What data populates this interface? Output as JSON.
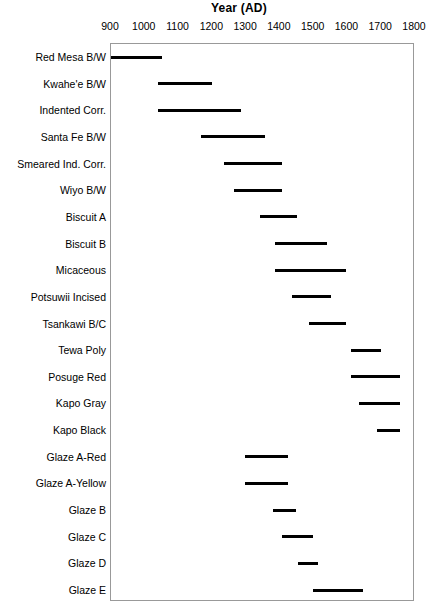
{
  "chart_data": {
    "type": "bar",
    "orientation": "horizontal-range",
    "title": "Year (AD)",
    "xlabel": "Year (AD)",
    "ylabel": "",
    "xlim": [
      900,
      1800
    ],
    "xticks": [
      900,
      1000,
      1100,
      1200,
      1300,
      1400,
      1500,
      1600,
      1700,
      1800
    ],
    "xtick_labels": [
      "900",
      "1000",
      "1100",
      "1200",
      "1300",
      "1400",
      "1500",
      "1600",
      "1700",
      "1800"
    ],
    "grid": false,
    "legend": null,
    "bar_color": "#000000",
    "frame_color": "#999999",
    "categories": [
      "Red Mesa B/W",
      "Kwahe'e B/W",
      "Indented Corr.",
      "Santa Fe B/W",
      "Smeared Ind. Corr.",
      "Wiyo B/W",
      "Biscuit A",
      "Biscuit B",
      "Micaceous",
      "Potsuwii Incised",
      "Tsankawi B/C",
      "Tewa Poly",
      "Posuge Red",
      "Kapo Gray",
      "Kapo Black",
      "Glaze A-Red",
      "Glaze A-Yellow",
      "Glaze B",
      "Glaze C",
      "Glaze D",
      "Glaze E"
    ],
    "ranges": [
      {
        "label": "Red Mesa B/W",
        "start": 900,
        "end": 1050
      },
      {
        "label": "Kwahe'e B/W",
        "start": 1040,
        "end": 1200
      },
      {
        "label": "Indented Corr.",
        "start": 1040,
        "end": 1285
      },
      {
        "label": "Santa Fe B/W",
        "start": 1165,
        "end": 1355
      },
      {
        "label": "Smeared Ind. Corr.",
        "start": 1235,
        "end": 1405
      },
      {
        "label": "Wiyo B/W",
        "start": 1265,
        "end": 1405
      },
      {
        "label": "Biscuit A",
        "start": 1340,
        "end": 1450
      },
      {
        "label": "Biscuit B",
        "start": 1385,
        "end": 1540
      },
      {
        "label": "Micaceous",
        "start": 1385,
        "end": 1595
      },
      {
        "label": "Potsuwii Incised",
        "start": 1435,
        "end": 1550
      },
      {
        "label": "Tsankawi B/C",
        "start": 1485,
        "end": 1595
      },
      {
        "label": "Tewa Poly",
        "start": 1610,
        "end": 1700
      },
      {
        "label": "Posuge Red",
        "start": 1610,
        "end": 1757
      },
      {
        "label": "Kapo Gray",
        "start": 1635,
        "end": 1757
      },
      {
        "label": "Kapo Black",
        "start": 1687,
        "end": 1755
      },
      {
        "label": "Glaze A-Red",
        "start": 1297,
        "end": 1425
      },
      {
        "label": "Glaze A-Yellow",
        "start": 1297,
        "end": 1425
      },
      {
        "label": "Glaze B",
        "start": 1380,
        "end": 1447
      },
      {
        "label": "Glaze C",
        "start": 1405,
        "end": 1497
      },
      {
        "label": "Glaze D",
        "start": 1453,
        "end": 1512
      },
      {
        "label": "Glaze E",
        "start": 1497,
        "end": 1645
      }
    ]
  }
}
